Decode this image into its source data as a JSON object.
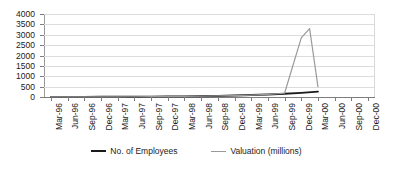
{
  "chart_data": {
    "type": "line",
    "title": "",
    "subtitle": "",
    "xlabel": "",
    "ylabel": "",
    "ylim": [
      0,
      4000
    ],
    "ytick_step": 500,
    "yticks": [
      "4000",
      "3500",
      "3000",
      "2500",
      "2000",
      "1500",
      "1000",
      "500",
      "0"
    ],
    "grid": true,
    "legend_position": "bottom",
    "categories": [
      "Mar-96",
      "Jun-96",
      "Sep-96",
      "Dec-96",
      "Mar-97",
      "Jun-97",
      "Sep-97",
      "Dec-97",
      "Mar-98",
      "Jun-98",
      "Sep-98",
      "Dec-98",
      "Mar-99",
      "Jun-99",
      "Sep-99",
      "Dec-99",
      "Mar-00",
      "Jun-00",
      "Sep-00",
      "Dec-00"
    ],
    "series": [
      {
        "name": "No. of Employees",
        "color": "#1a1a1a",
        "values": [
          5,
          6,
          8,
          10,
          12,
          15,
          18,
          22,
          28,
          35,
          50,
          70,
          95,
          120,
          155,
          200,
          260,
          null,
          null,
          null
        ]
      },
      {
        "name": "Valuation (millions)",
        "color": "#9a9a9a",
        "values": [
          2,
          3,
          4,
          6,
          8,
          11,
          14,
          18,
          25,
          35,
          50,
          70,
          95,
          130,
          180,
          2850,
          500,
          null,
          null,
          null
        ]
      }
    ],
    "peak": {
      "label": "Valuation peak",
      "value": 3300,
      "category": "Jan-00"
    },
    "axis_color": "#7d7d7d",
    "grid_color": "#dcdcdc",
    "background": "#ffffff"
  },
  "legend": {
    "entries": [
      {
        "label": "No. of Employees",
        "color": "#1a1a1a"
      },
      {
        "label": "Valuation (millions)",
        "color": "#9a9a9a"
      }
    ]
  }
}
